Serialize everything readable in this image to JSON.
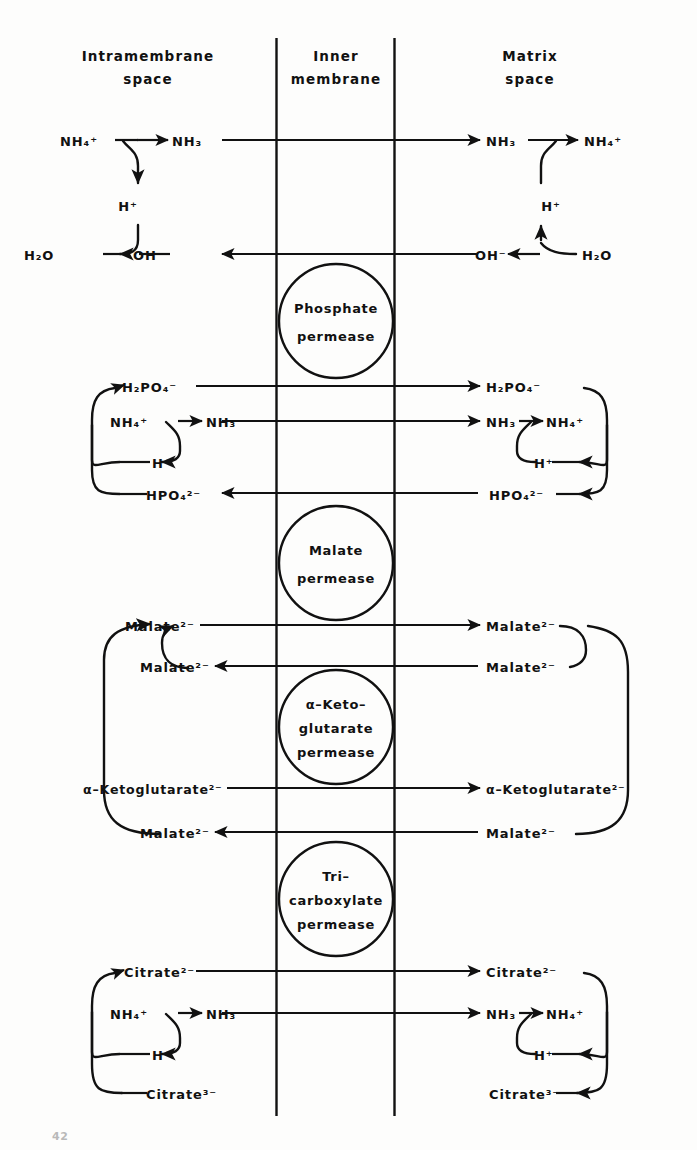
{
  "figure": {
    "headers": {
      "left_line1": "Intramembrane",
      "left_line2": "space",
      "mid_line1": "Inner",
      "mid_line2": "membrane",
      "right_line1": "Matrix",
      "right_line2": "space"
    },
    "permeases": [
      {
        "id": "phosphate",
        "lines": [
          "Phosphate",
          "permease"
        ]
      },
      {
        "id": "malate",
        "lines": [
          "Malate",
          "permease"
        ]
      },
      {
        "id": "ketoglutarate",
        "lines": [
          "α–Keto–",
          "glutarate",
          "permease"
        ]
      },
      {
        "id": "tricarboxylate",
        "lines": [
          "Tri–",
          "carboxylate",
          "permease"
        ]
      }
    ],
    "species": {
      "ammonium": {
        "base": "NH",
        "sub": "4",
        "sup": "+"
      },
      "ammonia": {
        "base": "NH",
        "sub": "3",
        "sup": ""
      },
      "proton": {
        "base": "H",
        "sub": "",
        "sup": "+"
      },
      "water": {
        "base": "H",
        "sub": "2",
        "sup": "",
        "tail": "O"
      },
      "hydroxide": {
        "base": "OH",
        "sub": "",
        "sup": "−"
      },
      "dihydrogen_phosphate": {
        "base": "H",
        "sub": "2",
        "tail": "PO",
        "sub2": "4",
        "sup": "−"
      },
      "hydrogen_phosphate": {
        "base": "HPO",
        "sub": "4",
        "sup": "2−"
      },
      "malate": {
        "base": "Malate",
        "sub": "",
        "sup": "2−"
      },
      "ketoglutarate": {
        "base": "α–Ketoglutarate",
        "sub": "",
        "sup": "2−"
      },
      "citrate2": {
        "base": "Citrate",
        "sub": "",
        "sup": "2−"
      },
      "citrate3": {
        "base": "Citrate",
        "sub": "",
        "sup": "3−"
      }
    },
    "labels": {
      "nh4_tl": "NH₄⁺",
      "nh3_tl": "NH₃",
      "h_tl": "H⁺",
      "h2o_tl": "H₂O",
      "oh_tl": "OH⁻",
      "nh3_tr": "NH₃",
      "nh4_tr": "NH₄⁺",
      "h_tr": "H⁺",
      "oh_tr": "OH⁻",
      "h2o_tr": "H₂O",
      "h2po4_l": "H₂PO₄⁻",
      "h2po4_r": "H₂PO₄⁻",
      "nh4_pl": "NH₄⁺",
      "nh3_pl": "NH₃",
      "nh3_pr": "NH₃",
      "nh4_pr": "NH₄⁺",
      "h_pl": "H⁺",
      "h_pr": "H⁺",
      "hpo4_l": "HPO₄²⁻",
      "hpo4_r": "HPO₄²⁻",
      "mal_l1": "Malate²⁻",
      "mal_r1": "Malate²⁻",
      "mal_l2": "Malate²⁻",
      "mal_r2": "Malate²⁻",
      "akg_l": "α–Ketoglutarate²⁻",
      "akg_r": "α–Ketoglutarate²⁻",
      "mal_l3": "Malate²⁻",
      "mal_r3": "Malate²⁻",
      "cit2_l": "Citrate²⁻",
      "cit2_r": "Citrate²⁻",
      "nh4_cl": "NH₄⁺",
      "nh3_cl": "NH₃",
      "nh3_cr": "NH₃",
      "nh4_cr": "NH₄⁺",
      "h_cl": "H⁺",
      "h_cr": "H⁺",
      "cit3_l": "Citrate³⁻",
      "cit3_r": "Citrate³⁻"
    },
    "footnote": "42",
    "colors": {
      "ink": "#111111",
      "paper": "#fdfdfc"
    }
  }
}
